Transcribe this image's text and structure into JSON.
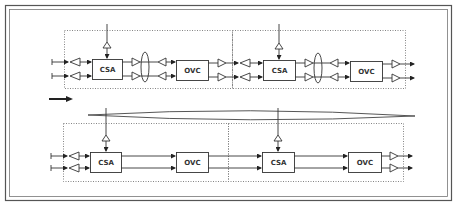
{
  "diagram": {
    "colors": {
      "line": "#333333",
      "frame": "#555555",
      "dotted": "#777777",
      "background": "#ffffff"
    },
    "top_row": {
      "stage1": {
        "csa_label": "CSA",
        "ovc_label": "OVC"
      },
      "stage2": {
        "csa_label": "CSA",
        "ovc_label": "OVC"
      }
    },
    "bottom_row": {
      "stage1": {
        "csa_label": "CSA",
        "ovc_label": "OVC"
      },
      "stage2": {
        "csa_label": "CSA",
        "ovc_label": "OVC"
      }
    },
    "icons": {
      "flow_arrow": "arrow-right-icon",
      "buffer": "triangle-buffer-icon",
      "bundle": "ellipse-bundle-icon"
    }
  }
}
